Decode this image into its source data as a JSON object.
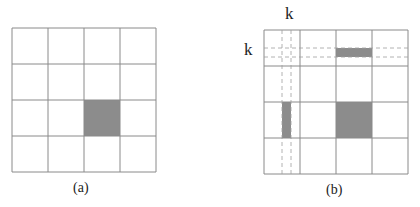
{
  "panels": [
    {
      "id": "a",
      "caption": "(a)",
      "grid_size": 4,
      "shaded_cells": [
        {
          "row": 2,
          "col": 2
        }
      ]
    },
    {
      "id": "b",
      "caption": "(b)",
      "grid_size": 4,
      "row_label": "k",
      "col_label": "k",
      "shaded_blocks": [
        {
          "description": "block in row k band, column 2",
          "row": 0,
          "col": 2,
          "band": "row-k"
        },
        {
          "description": "block in column k band, row 2",
          "row": 2,
          "col": 0,
          "band": "col-k"
        },
        {
          "description": "full cell",
          "row": 2,
          "col": 2
        }
      ]
    }
  ],
  "colors": {
    "grid_line": "#8a8a8a",
    "shade": "#8c8c8c",
    "dashed": "#a0a0a0"
  },
  "footer_text": "Figure 1.1"
}
